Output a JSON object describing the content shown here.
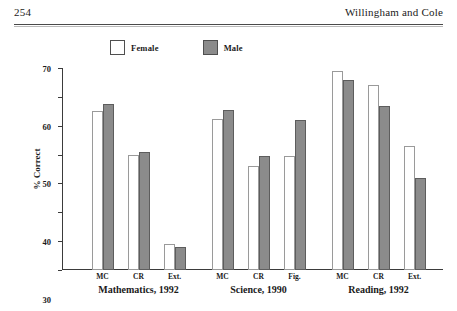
{
  "header": {
    "folio": "254",
    "running_head": "Willingham and Cole"
  },
  "legend": {
    "items": [
      {
        "label": "Female",
        "swatch": "white-square-icon",
        "color": "#ffffff"
      },
      {
        "label": "Male",
        "swatch": "gray-square-icon",
        "color": "#8b8b8b"
      }
    ]
  },
  "chart_data": {
    "type": "bar",
    "title": "",
    "xlabel": "",
    "ylabel": "% Correct",
    "ylim": [
      0,
      70
    ],
    "yticks": [
      0,
      10,
      20,
      30,
      40,
      50,
      60,
      70
    ],
    "grid": false,
    "legend_position": "top-center",
    "categories": [
      "MC",
      "CR",
      "Ext.",
      "MC",
      "CR",
      "Fig.",
      "MC",
      "CR",
      "Ext."
    ],
    "groups": [
      {
        "label": "Mathematics, 1992",
        "categories": [
          "MC",
          "CR",
          "Ext."
        ]
      },
      {
        "label": "Science, 1990",
        "categories": [
          "MC",
          "CR",
          "Fig."
        ]
      },
      {
        "label": "Reading, 1992",
        "categories": [
          "MC",
          "CR",
          "Ext."
        ]
      }
    ],
    "series": [
      {
        "name": "Female",
        "values": [
          55,
          40,
          9,
          52.5,
          36,
          39.5,
          69,
          64,
          43
        ]
      },
      {
        "name": "Male",
        "values": [
          57.5,
          41,
          8,
          55.5,
          39.5,
          52,
          66,
          57,
          32
        ]
      }
    ]
  }
}
